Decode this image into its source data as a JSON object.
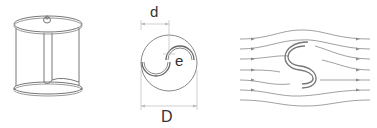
{
  "figure": {
    "panels": [
      {
        "id": "rotor-3d",
        "description": "Savonius rotor cylinder view"
      },
      {
        "id": "cross-section",
        "labels": {
          "d": "d",
          "e": "e",
          "D": "D"
        }
      },
      {
        "id": "flow-field",
        "description": "Streamlines around S-shaped rotor"
      }
    ]
  },
  "colors": {
    "stroke": "#777777",
    "light": "#aaaaaa",
    "text": "#333333"
  }
}
